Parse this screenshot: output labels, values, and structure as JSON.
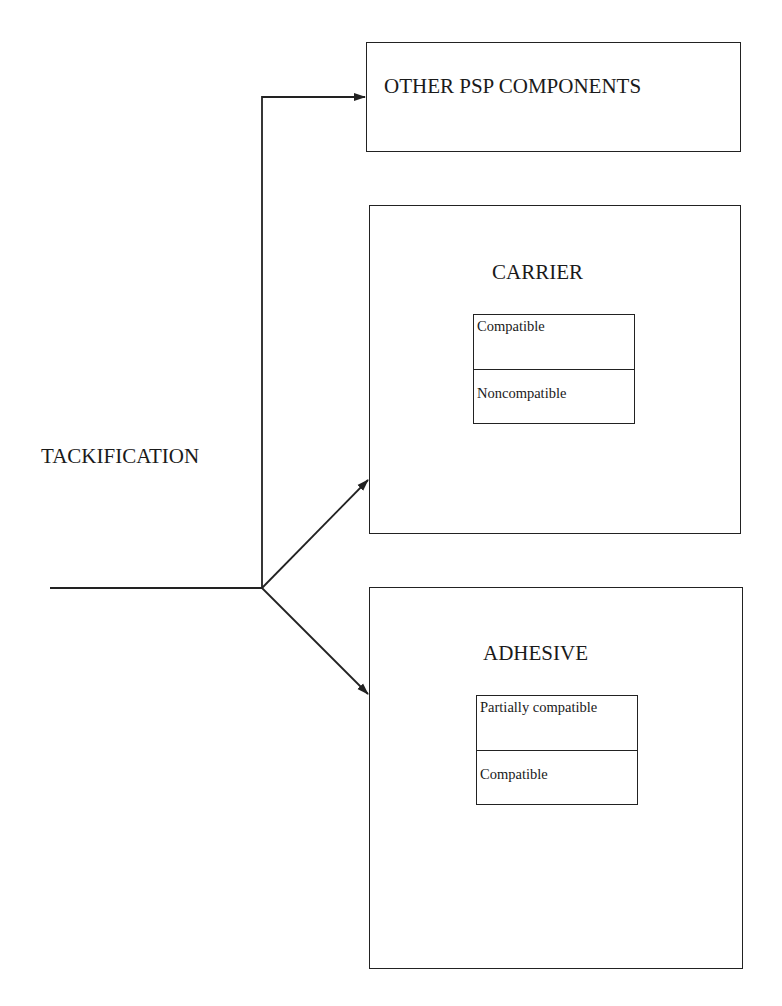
{
  "diagram": {
    "source_label": "TACKIFICATION",
    "targets": [
      {
        "title": "OTHER PSP COMPONENTS"
      },
      {
        "title": "CARRIER",
        "properties": [
          "Compatible",
          "Noncompatible"
        ]
      },
      {
        "title": "ADHESIVE",
        "properties": [
          "Partially compatible",
          "Compatible"
        ]
      }
    ],
    "colors": {
      "line": "#222222",
      "text": "#1a1a1a",
      "background": "#ffffff"
    }
  }
}
